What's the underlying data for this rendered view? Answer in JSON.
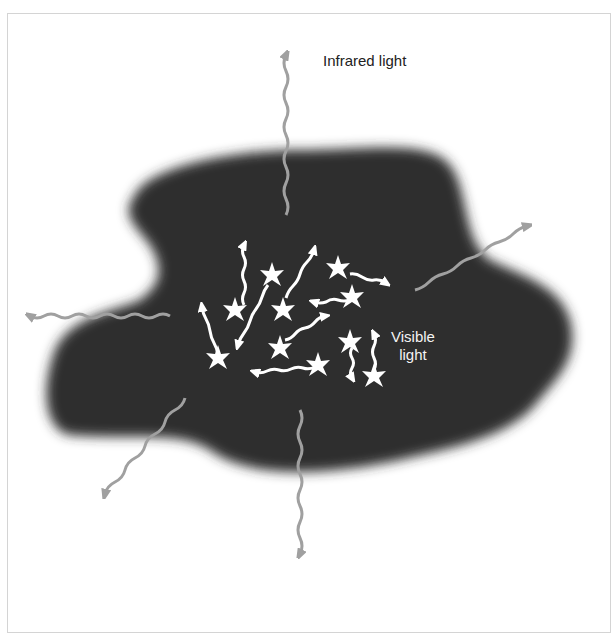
{
  "figure": {
    "header_fragment": "y  y",
    "labels": {
      "infrared": "Infrared light",
      "visible_line1": "Visible",
      "visible_line2": "light"
    },
    "colors": {
      "cloud": "#2e2e2e",
      "infrared_arrow": "#a0a0a0",
      "visible_arrow": "#ffffff",
      "background": "#ffffff",
      "frame": "#d4d4d4"
    },
    "infrared_arrows": [
      {
        "direction": "up",
        "label": "Infrared light"
      },
      {
        "direction": "up-right"
      },
      {
        "direction": "left"
      },
      {
        "direction": "down-left"
      },
      {
        "direction": "down"
      }
    ],
    "stars_count": 9
  }
}
